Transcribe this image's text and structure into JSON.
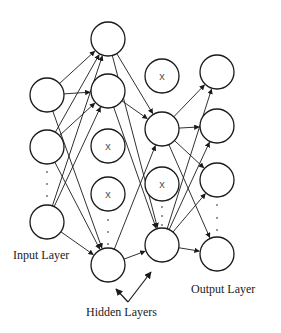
{
  "labels": {
    "input": "Input Layer",
    "hidden": "Hidden Layers",
    "output": "Output Layer"
  },
  "layers": [
    {
      "name": "input",
      "x": 47,
      "nodes": [
        95,
        147,
        222
      ],
      "dropped": [],
      "ellipsis_y": [
        172,
        184,
        196
      ]
    },
    {
      "name": "hidden1",
      "x": 108,
      "nodes": [
        39,
        91,
        146,
        194,
        265
      ],
      "dropped": [
        2,
        3
      ],
      "ellipsis_y": [
        220,
        232,
        244
      ]
    },
    {
      "name": "hidden2",
      "x": 162,
      "nodes": [
        76,
        129,
        184,
        245
      ],
      "dropped": [
        0,
        2
      ],
      "ellipsis_y": [
        207,
        216,
        225
      ]
    },
    {
      "name": "output",
      "x": 217,
      "nodes": [
        72,
        126,
        180,
        254
      ],
      "dropped": [],
      "ellipsis_y": [
        205,
        218,
        230
      ]
    }
  ],
  "node_radius": 17,
  "dropout_mark": "x",
  "colors": {
    "stroke": "#1a1a1a",
    "text": "#222222",
    "mark": "#555555"
  }
}
